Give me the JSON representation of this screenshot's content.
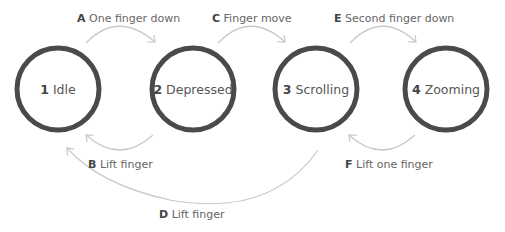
{
  "colors": {
    "circle_stroke": "#4a4a4a",
    "arrow": "#c8c8c8",
    "label_text": "#555555"
  },
  "states": [
    {
      "num": "1",
      "name": "Idle"
    },
    {
      "num": "2",
      "name": "Depressed"
    },
    {
      "num": "3",
      "name": "Scrolling"
    },
    {
      "num": "4",
      "name": "Zooming"
    }
  ],
  "transitions": [
    {
      "key": "A",
      "label": "One finger down"
    },
    {
      "key": "B",
      "label": "Lift finger"
    },
    {
      "key": "C",
      "label": "Finger move"
    },
    {
      "key": "D",
      "label": "Lift finger"
    },
    {
      "key": "E",
      "label": "Second finger down"
    },
    {
      "key": "F",
      "label": "Lift one finger"
    }
  ]
}
